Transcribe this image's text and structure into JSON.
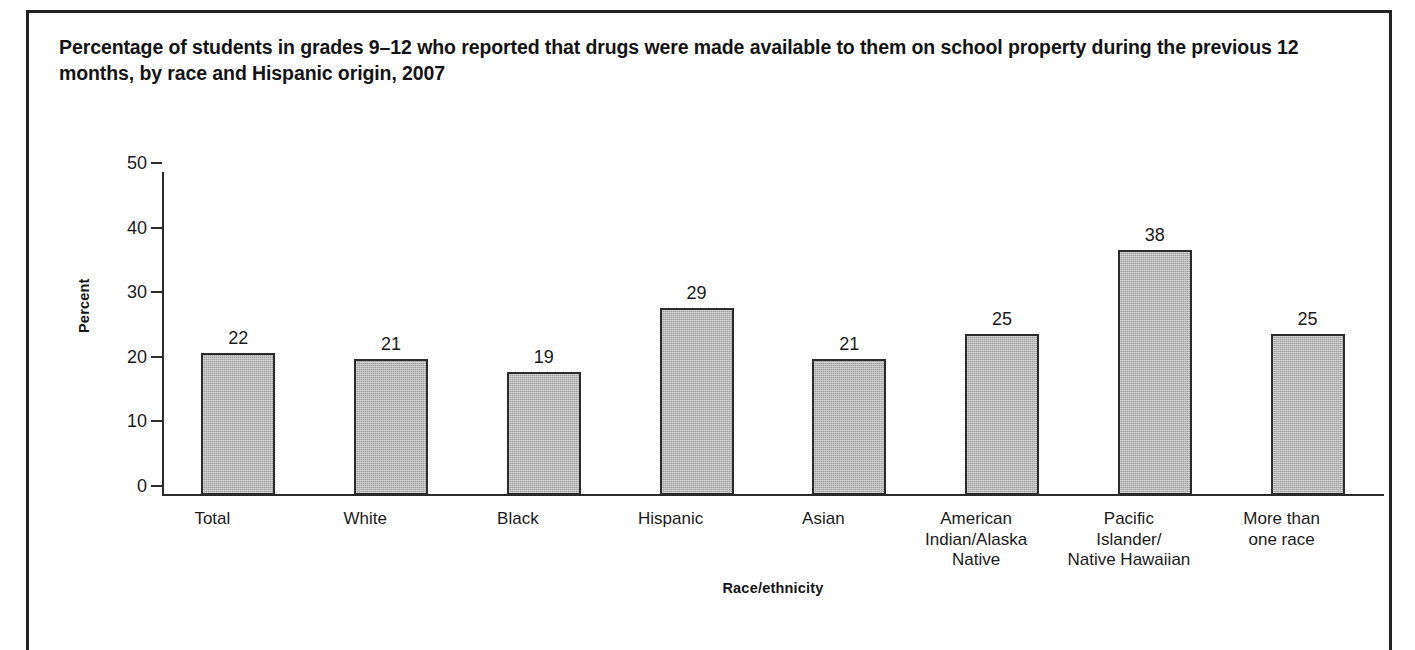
{
  "figure": {
    "title": "Percentage of students in grades 9–12 who reported that drugs were made available to them on school property during the previous 12 months, by race and Hispanic origin, 2007"
  },
  "chart_data": {
    "type": "bar",
    "title": "Percentage of students in grades 9–12 who reported that drugs were made available to them on school property during the previous 12 months, by race and Hispanic origin, 2007",
    "xlabel": "Race/ethnicity",
    "ylabel": "Percent",
    "ylim": [
      0,
      50
    ],
    "yticks": [
      0,
      10,
      20,
      30,
      40,
      50
    ],
    "ytick_labels": [
      "0",
      "10",
      "20",
      "30",
      "40",
      "50"
    ],
    "grid": false,
    "legend": "none",
    "categories": [
      "Total",
      "White",
      "Black",
      "Hispanic",
      "Asian",
      "American Indian/Alaska Native",
      "Pacific Islander/Native Hawaiian",
      "More than one race"
    ],
    "category_label_lines": [
      [
        "Total"
      ],
      [
        "White"
      ],
      [
        "Black"
      ],
      [
        "Hispanic"
      ],
      [
        "Asian"
      ],
      [
        "American",
        "Indian/Alaska",
        "Native"
      ],
      [
        "Pacific",
        "Islander/",
        "Native Hawaiian"
      ],
      [
        "More than",
        "one race"
      ]
    ],
    "values": [
      22,
      21,
      19,
      29,
      21,
      25,
      38,
      25
    ],
    "value_labels": [
      "22",
      "21",
      "19",
      "29",
      "21",
      "25",
      "38",
      "25"
    ],
    "bar_fill_color": "#b4b4b4",
    "bar_border_color": "#2b2b2b",
    "axis_color": "#2b2b2b"
  }
}
